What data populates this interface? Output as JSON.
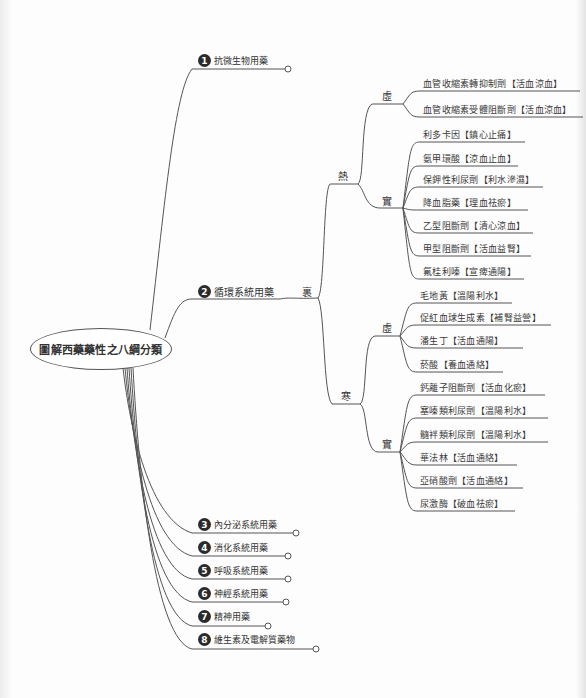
{
  "root": {
    "label": "圖解西藥藥性之八綱分類"
  },
  "categories": [
    {
      "num": "1",
      "label": "抗微生物用藥"
    },
    {
      "num": "2",
      "label": "循環系統用藥"
    },
    {
      "num": "3",
      "label": "內分泌系統用藥"
    },
    {
      "num": "4",
      "label": "消化系統用藥"
    },
    {
      "num": "5",
      "label": "呼吸系統用藥"
    },
    {
      "num": "6",
      "label": "神經系統用藥"
    },
    {
      "num": "7",
      "label": "精神用藥"
    },
    {
      "num": "8",
      "label": "維生素及電解質藥物"
    }
  ],
  "circulatory": {
    "interior_label": "裏",
    "hot": {
      "label": "熱",
      "deficiency": {
        "label": "虛",
        "items": [
          "血管收縮素轉抑制劑【活血涼血】",
          "血管收縮素受體阻斷劑【活血涼血】"
        ]
      },
      "excess": {
        "label": "實",
        "items": [
          "利多卡因【鎮心止痛】",
          "氨甲環酸【涼血止血】",
          "保鉀性利尿劑【利水滲濕】",
          "降血脂藥【理血祛瘀】",
          "乙型阻斷劑【清心涼血】",
          "甲型阻斷劑【活血益腎】",
          "氟桂利嗪【宣痺通陽】"
        ]
      }
    },
    "cold": {
      "label": "寒",
      "deficiency": {
        "label": "虛",
        "items": [
          "毛地黃【溫陽利水】",
          "促紅血球生成素【補腎益營】",
          "潘生丁【活血通陽】",
          "菸酸【養血通絡】"
        ]
      },
      "excess": {
        "label": "實",
        "items": [
          "鈣離子阻斷劑【活血化瘀】",
          "塞嗪類利尿劑【溫陽利水】",
          "髓袢類利尿劑【溫陽利水】",
          "華法林【活血通絡】",
          "亞硝酸劑【活血通絡】",
          "尿激酶【破血祛瘀】"
        ]
      }
    }
  },
  "colors": {
    "line": "#555555",
    "badge": "#2b2b2b",
    "text": "#333333"
  }
}
